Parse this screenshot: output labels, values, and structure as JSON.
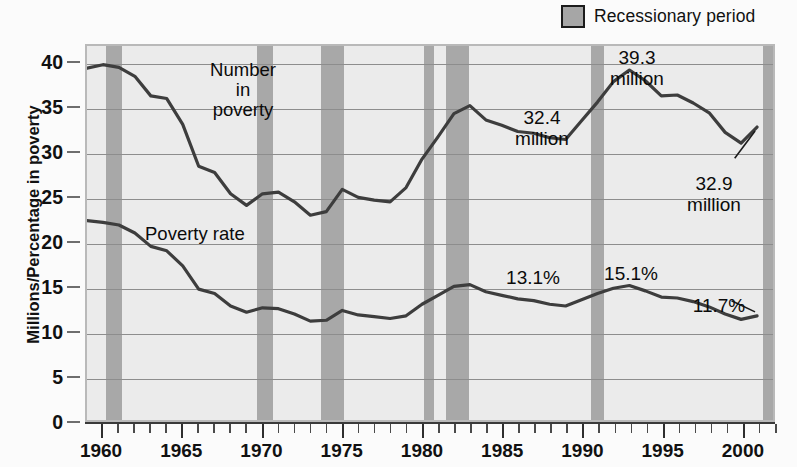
{
  "legend": {
    "swatch_name": "recession-band-swatch",
    "label": "Recessionary period",
    "swatch_color": "#a6a6a6"
  },
  "axes": {
    "y_title": "Millions/Percentage in poverty",
    "y_ticks": [
      "0",
      "5",
      "10",
      "15",
      "20",
      "25",
      "30",
      "35",
      "40"
    ],
    "x_ticks": [
      "1960",
      "1965",
      "1970",
      "1975",
      "1980",
      "1985",
      "1990",
      "1995",
      "2000"
    ]
  },
  "series_labels": {
    "number": "Number\nin\npoverty",
    "rate": "Poverty rate"
  },
  "annotations": {
    "a1": "32.4\nmillion",
    "a2": "39.3\nmillion",
    "a3": "32.9\nmillion",
    "a4": "13.1%",
    "a5": "15.1%",
    "a6": "11.7%"
  },
  "colors": {
    "plot_background": "#ebebeb",
    "gridline": "#8d8d8d",
    "recession_band": "#a8a8a8",
    "line": "#3d3d3d",
    "frame": "#b9b9b9"
  },
  "chart_data": {
    "type": "line",
    "title": "",
    "xlabel": "",
    "ylabel": "Millions/Percentage in poverty",
    "xlim": [
      1959,
      2002
    ],
    "ylim": [
      0,
      42
    ],
    "grid": true,
    "legend_position": "top-right",
    "x": [
      1959,
      1960,
      1961,
      1962,
      1963,
      1964,
      1965,
      1966,
      1967,
      1968,
      1969,
      1970,
      1971,
      1972,
      1973,
      1974,
      1975,
      1976,
      1977,
      1978,
      1979,
      1980,
      1981,
      1982,
      1983,
      1984,
      1985,
      1986,
      1987,
      1988,
      1989,
      1990,
      1991,
      1992,
      1993,
      1994,
      1995,
      1996,
      1997,
      1998,
      1999,
      2000,
      2001
    ],
    "series": [
      {
        "name": "Number in poverty",
        "unit": "millions",
        "values": [
          39.5,
          39.9,
          39.6,
          38.6,
          36.4,
          36.1,
          33.2,
          28.5,
          27.8,
          25.4,
          24.1,
          25.4,
          25.6,
          24.5,
          23.0,
          23.4,
          25.9,
          25.0,
          24.7,
          24.5,
          26.1,
          29.3,
          31.8,
          34.4,
          35.3,
          33.7,
          33.1,
          32.4,
          32.2,
          31.7,
          31.5,
          33.6,
          35.7,
          38.0,
          39.3,
          38.1,
          36.4,
          36.5,
          35.6,
          34.5,
          32.3,
          31.1,
          32.9
        ]
      },
      {
        "name": "Poverty rate",
        "unit": "percent",
        "values": [
          22.4,
          22.2,
          21.9,
          21.0,
          19.5,
          19.0,
          17.3,
          14.7,
          14.2,
          12.8,
          12.1,
          12.6,
          12.5,
          11.9,
          11.1,
          11.2,
          12.3,
          11.8,
          11.6,
          11.4,
          11.7,
          13.0,
          14.0,
          15.0,
          15.2,
          14.4,
          14.0,
          13.6,
          13.4,
          13.0,
          12.8,
          13.5,
          14.2,
          14.8,
          15.1,
          14.5,
          13.8,
          13.7,
          13.3,
          12.7,
          11.9,
          11.3,
          11.7
        ]
      }
    ],
    "recession_bands": [
      {
        "start": 1960.2,
        "end": 1961.2
      },
      {
        "start": 1969.6,
        "end": 1970.6
      },
      {
        "start": 1973.6,
        "end": 1975.0
      },
      {
        "start": 1980.0,
        "end": 1980.6
      },
      {
        "start": 1981.4,
        "end": 1982.8
      },
      {
        "start": 1990.4,
        "end": 1991.2
      },
      {
        "start": 2001.1,
        "end": 2001.9
      }
    ],
    "callouts": [
      {
        "label": "32.4\nmillion",
        "series": "Number in poverty",
        "year": 1987,
        "value": 32.4
      },
      {
        "label": "39.3\nmillion",
        "series": "Number in poverty",
        "year": 1993,
        "value": 39.3
      },
      {
        "label": "32.9\nmillion",
        "series": "Number in poverty",
        "year": 2001,
        "value": 32.9
      },
      {
        "label": "13.1%",
        "series": "Poverty rate",
        "year": 1989,
        "value": 13.1
      },
      {
        "label": "15.1%",
        "series": "Poverty rate",
        "year": 1993,
        "value": 15.1
      },
      {
        "label": "11.7%",
        "series": "Poverty rate",
        "year": 2001,
        "value": 11.7
      }
    ]
  }
}
